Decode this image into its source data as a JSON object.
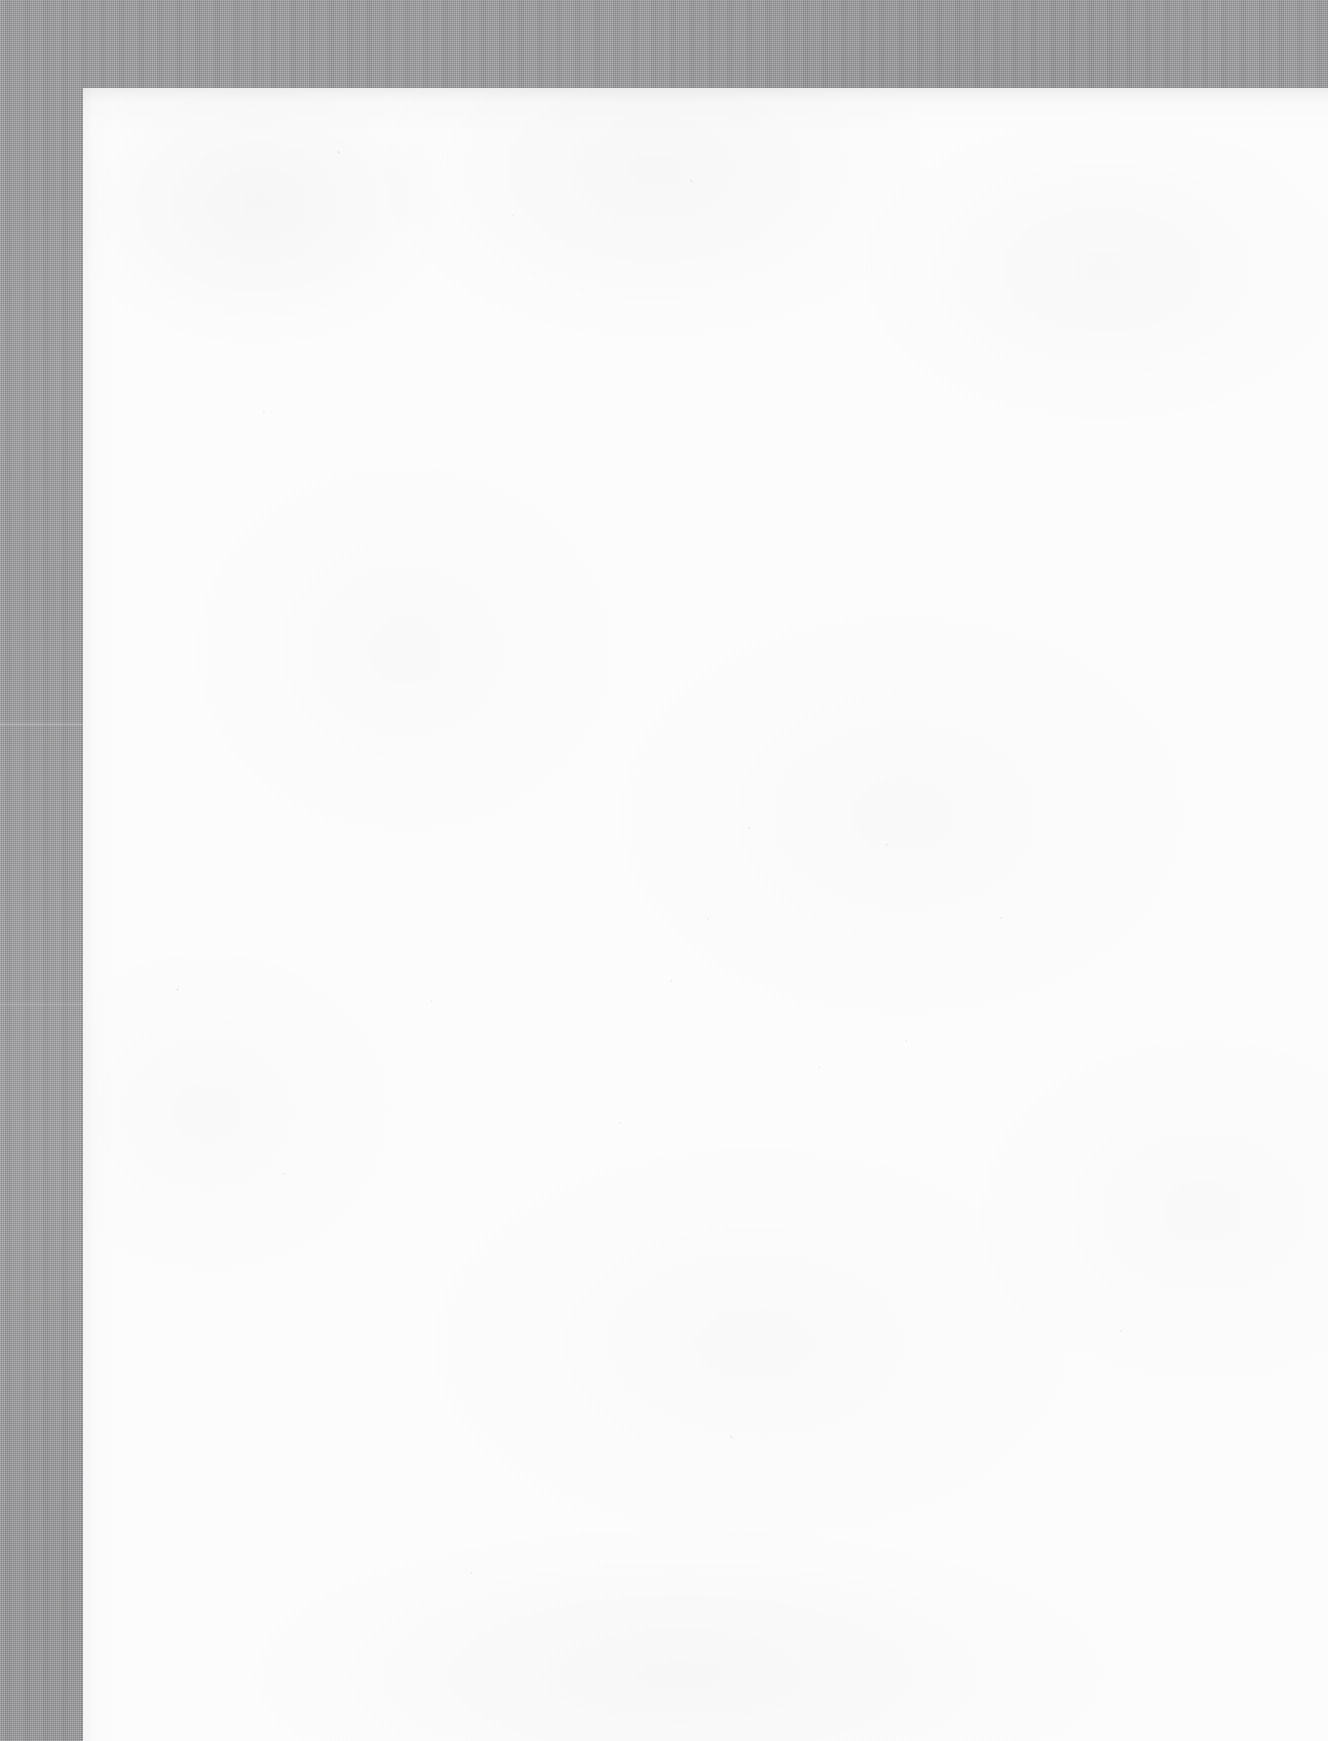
{
  "document": {
    "kind": "scanned-page-image",
    "page_content_text": "",
    "visible_text_count": 0,
    "description_label": "Blank scanned page"
  },
  "canvas": {
    "width_px": 1328,
    "height_px": 1741
  },
  "scanner_background": {
    "name": "scanner-bed-background",
    "color": "#9b9b9d",
    "texture": "halftone-dither-vertical-streak",
    "top_band_height_px": 88,
    "left_strip_width_px": 83,
    "seam_y_px": 723
  },
  "paper": {
    "name": "scanned-paper-sheet",
    "color": "#fdfdfd",
    "edge_shadow_color": "#000000",
    "left_px": 83,
    "top_px": 88,
    "width_px": 1245,
    "height_px": 1653,
    "bleeds_right": true,
    "bleeds_bottom": true,
    "surface": "blank"
  },
  "specks": [
    {
      "x": 337,
      "y": 151,
      "size": 3,
      "opacity": 0.05
    },
    {
      "x": 512,
      "y": 214,
      "size": 2,
      "opacity": 0.04
    },
    {
      "x": 690,
      "y": 179,
      "size": 3,
      "opacity": 0.04
    },
    {
      "x": 263,
      "y": 411,
      "size": 2,
      "opacity": 0.05
    },
    {
      "x": 748,
      "y": 827,
      "size": 2,
      "opacity": 0.05
    },
    {
      "x": 885,
      "y": 843,
      "size": 3,
      "opacity": 0.04
    },
    {
      "x": 707,
      "y": 918,
      "size": 2,
      "opacity": 0.04
    },
    {
      "x": 176,
      "y": 988,
      "size": 3,
      "opacity": 0.05
    },
    {
      "x": 670,
      "y": 980,
      "size": 2,
      "opacity": 0.04
    },
    {
      "x": 1000,
      "y": 917,
      "size": 2,
      "opacity": 0.04
    },
    {
      "x": 430,
      "y": 1000,
      "size": 2,
      "opacity": 0.04
    },
    {
      "x": 905,
      "y": 1040,
      "size": 2,
      "opacity": 0.04
    },
    {
      "x": 619,
      "y": 1122,
      "size": 2,
      "opacity": 0.04
    },
    {
      "x": 818,
      "y": 1066,
      "size": 2,
      "opacity": 0.04
    },
    {
      "x": 283,
      "y": 1173,
      "size": 2,
      "opacity": 0.04
    },
    {
      "x": 1120,
      "y": 1330,
      "size": 2,
      "opacity": 0.04
    },
    {
      "x": 730,
      "y": 1435,
      "size": 3,
      "opacity": 0.04
    },
    {
      "x": 470,
      "y": 1572,
      "size": 2,
      "opacity": 0.04
    }
  ]
}
